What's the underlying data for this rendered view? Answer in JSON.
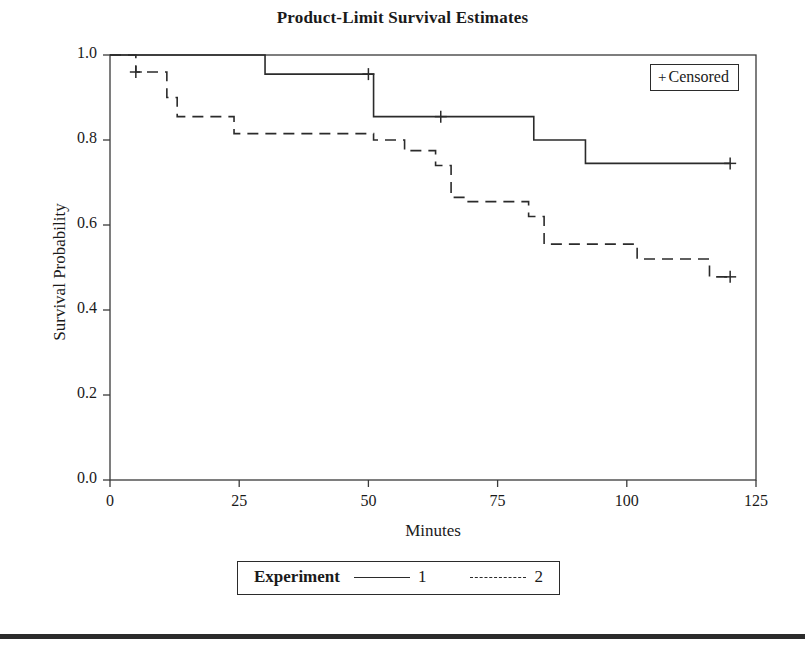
{
  "chart_data": {
    "type": "line",
    "title": "Product-Limit Survival Estimates",
    "xlabel": "Minutes",
    "ylabel": "Survival Probability",
    "xlim": [
      0,
      125
    ],
    "ylim": [
      0.0,
      1.0
    ],
    "xticks": [
      "0",
      "25",
      "50",
      "75",
      "100",
      "125"
    ],
    "xtick_values": [
      0,
      25,
      50,
      75,
      100,
      125
    ],
    "yticks": [
      "0.0",
      "0.2",
      "0.4",
      "0.6",
      "0.8",
      "1.0"
    ],
    "ytick_values": [
      0.0,
      0.2,
      0.4,
      0.6,
      0.8,
      1.0
    ],
    "grid": false,
    "step_type": "post",
    "legend_position": "bottom",
    "legend_title": "Experiment",
    "censor_legend": "Censored",
    "censor_marker": "+",
    "series": [
      {
        "name": "1",
        "label": "1",
        "linestyle": "solid",
        "color": "#2b2b2b",
        "x": [
          0,
          30,
          30,
          51,
          51,
          82,
          82,
          92,
          92,
          120
        ],
        "y": [
          1.0,
          1.0,
          0.955,
          0.955,
          0.855,
          0.855,
          0.8,
          0.8,
          0.745,
          0.745
        ],
        "steps": [
          {
            "time": 0,
            "survival": 1.0
          },
          {
            "time": 30,
            "survival": 0.955
          },
          {
            "time": 51,
            "survival": 0.855
          },
          {
            "time": 82,
            "survival": 0.8
          },
          {
            "time": 92,
            "survival": 0.745
          },
          {
            "time": 120,
            "survival": 0.745
          }
        ],
        "censored": [
          {
            "time": 50,
            "survival": 0.955
          },
          {
            "time": 64,
            "survival": 0.855
          },
          {
            "time": 120,
            "survival": 0.745
          }
        ]
      },
      {
        "name": "2",
        "label": "2",
        "linestyle": "dashed",
        "color": "#2b2b2b",
        "x": [
          0,
          5,
          5,
          11,
          11,
          13,
          13,
          24,
          24,
          51,
          51,
          57,
          57,
          63,
          63,
          66,
          66,
          69,
          69,
          81,
          81,
          84,
          84,
          102,
          102,
          116,
          116,
          120
        ],
        "y": [
          1.0,
          1.0,
          0.96,
          0.96,
          0.9,
          0.9,
          0.855,
          0.855,
          0.815,
          0.815,
          0.8,
          0.8,
          0.775,
          0.775,
          0.74,
          0.74,
          0.665,
          0.665,
          0.655,
          0.655,
          0.62,
          0.62,
          0.555,
          0.555,
          0.52,
          0.52,
          0.478,
          0.478
        ],
        "steps": [
          {
            "time": 0,
            "survival": 1.0
          },
          {
            "time": 5,
            "survival": 0.96
          },
          {
            "time": 11,
            "survival": 0.9
          },
          {
            "time": 13,
            "survival": 0.855
          },
          {
            "time": 24,
            "survival": 0.815
          },
          {
            "time": 51,
            "survival": 0.8
          },
          {
            "time": 57,
            "survival": 0.775
          },
          {
            "time": 63,
            "survival": 0.74
          },
          {
            "time": 66,
            "survival": 0.665
          },
          {
            "time": 69,
            "survival": 0.655
          },
          {
            "time": 81,
            "survival": 0.62
          },
          {
            "time": 84,
            "survival": 0.555
          },
          {
            "time": 102,
            "survival": 0.52
          },
          {
            "time": 116,
            "survival": 0.478
          },
          {
            "time": 120,
            "survival": 0.478
          }
        ],
        "censored": [
          {
            "time": 5,
            "survival": 0.96
          },
          {
            "time": 120,
            "survival": 0.478
          }
        ]
      }
    ]
  },
  "colors": {
    "line": "#2b2b2b",
    "axis": "#3a3a3a",
    "text": "#1a1a1a",
    "background": "#ffffff",
    "footer_rule": "#2b2b2b"
  }
}
